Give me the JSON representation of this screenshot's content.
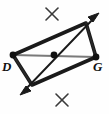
{
  "figure": {
    "name": "quadrilateral-perpendicular-bisector-construction",
    "width": 109,
    "height": 114,
    "background_color": "#fefefe",
    "stroke_color": "#1a1a1a",
    "thin_stroke_color": "#6f6f6f",
    "labels": {
      "left_vertex": "D",
      "right_vertex": "G"
    },
    "vertices": {
      "left": {
        "x": 13,
        "y": 55
      },
      "top": {
        "x": 86,
        "y": 23
      },
      "right": {
        "x": 96,
        "y": 57
      },
      "bottom": {
        "x": 32,
        "y": 85
      },
      "center": {
        "x": 54,
        "y": 55
      }
    },
    "construction_marks": [
      {
        "name": "x-mark-top",
        "x": 52,
        "y": 14,
        "size": 11
      },
      {
        "name": "x-mark-bottom",
        "x": 62,
        "y": 100,
        "size": 11
      }
    ],
    "bisector_arrow": {
      "name": "double-headed-bisector-line",
      "start": {
        "x": 22,
        "y": 93
      },
      "end": {
        "x": 97,
        "y": 15
      },
      "arrowheads": "both"
    }
  }
}
